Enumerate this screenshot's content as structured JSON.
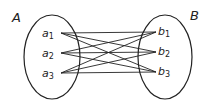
{
  "diagram": {
    "type": "set-mapping",
    "sets": [
      {
        "name": "A",
        "elements": [
          {
            "base": "a",
            "sub": "1"
          },
          {
            "base": "a",
            "sub": "2"
          },
          {
            "base": "a",
            "sub": "3"
          }
        ]
      },
      {
        "name": "B",
        "elements": [
          {
            "base": "b",
            "sub": "1"
          },
          {
            "base": "b",
            "sub": "2"
          },
          {
            "base": "b",
            "sub": "3"
          }
        ]
      }
    ],
    "edges": [
      [
        "a1",
        "b1"
      ],
      [
        "a1",
        "b2"
      ],
      [
        "a1",
        "b3"
      ],
      [
        "a2",
        "b1"
      ],
      [
        "a2",
        "b2"
      ],
      [
        "a2",
        "b3"
      ],
      [
        "a3",
        "b1"
      ],
      [
        "a3",
        "b2"
      ],
      [
        "a3",
        "b3"
      ]
    ],
    "stroke_color": "#222222"
  }
}
